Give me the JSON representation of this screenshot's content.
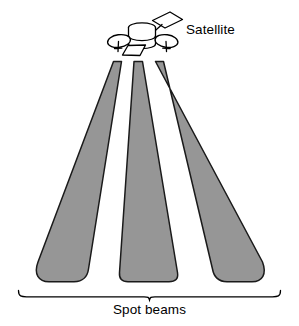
{
  "figure": {
    "kind": "satellite-spot-beam-diagram",
    "background_color": "#ffffff",
    "width": 299,
    "height": 326
  },
  "labels": {
    "satellite": "Satellite",
    "spot_beams": "Spot beams"
  },
  "colors": {
    "beam_fill": "#969696",
    "beam_stroke": "#1a1a1a",
    "line": "#000000",
    "text": "#000000",
    "satellite_fill": "#ffffff"
  },
  "satellite": {
    "name": "communications-satellite",
    "parts": [
      "solar-panel",
      "body-cylinder",
      "lower-panel",
      "left-dish-antenna",
      "right-dish-antenna",
      "antenna-boom"
    ]
  },
  "beams": [
    {
      "name": "left-spot-beam",
      "label": "left"
    },
    {
      "name": "center-spot-beam",
      "label": "center"
    },
    {
      "name": "right-spot-beam",
      "label": "right"
    }
  ],
  "brace": {
    "name": "spot-beams-brace",
    "orientation": "horizontal",
    "points_to": "Spot beams"
  }
}
